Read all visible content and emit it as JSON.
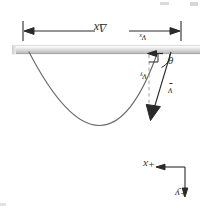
{
  "figure": {
    "orientation": "rotated-180",
    "labels": {
      "delta_x": "Δx",
      "v_x": "vₓ",
      "v_y": "vᵧ",
      "theta": "θ",
      "v_resultant": "v",
      "axis_x": "+x",
      "axis_y": "+y"
    },
    "colors": {
      "curve": "#5a5a5a",
      "bar_light": "#f4f4f4",
      "bar_mid": "#d8d8d8",
      "bar_dark": "#b9b9b9",
      "ink": "#2a2a2a",
      "dashed": "#9a9a9a",
      "background": "#ffffff"
    },
    "geometry": {
      "bar_y_top": 45,
      "bar_y_bottom": 54,
      "bar_x_left": 12,
      "bar_x_right": 200,
      "dimension_line_y": 31,
      "dimension_x_left": 23,
      "dimension_x_right": 181,
      "parabola_vertex": [
        105,
        155
      ],
      "launch_point": [
        29,
        52
      ],
      "impact_point": [
        157,
        54
      ],
      "arrow_tip": [
        152,
        119
      ],
      "axis_origin": [
        185,
        167
      ],
      "axis_x_tip": [
        152,
        167
      ],
      "axis_y_tip": [
        185,
        197
      ]
    }
  }
}
